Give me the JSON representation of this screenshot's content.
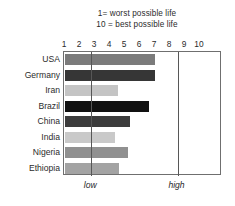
{
  "chart_data": {
    "type": "bar",
    "orientation": "horizontal",
    "title": "",
    "subtitle_lines": [
      "1= worst possible life",
      "10 = best possible life"
    ],
    "categories": [
      "USA",
      "Germany",
      "Iran",
      "Brazil",
      "China",
      "India",
      "Nigeria",
      "Ethiopia"
    ],
    "values": [
      7.0,
      7.0,
      4.5,
      6.6,
      5.3,
      4.3,
      5.2,
      4.6
    ],
    "bar_colors": [
      "#7b7b7b",
      "#363636",
      "#c4c4c4",
      "#111111",
      "#3c3c3c",
      "#c9c9c9",
      "#909090",
      "#a3a3a3"
    ],
    "series": [
      {
        "name": "life evaluation",
        "values": [
          7.0,
          7.0,
          4.5,
          6.6,
          5.3,
          4.3,
          5.2,
          4.6
        ]
      }
    ],
    "xlabel": "",
    "ylabel": "",
    "xlim": [
      1,
      11.5
    ],
    "xticks": [
      1,
      2,
      3,
      4,
      5,
      6,
      7,
      8,
      9,
      10
    ],
    "xticklabels": [
      "1",
      "2",
      "3",
      "4",
      "5",
      "6",
      "7",
      "8",
      "9",
      "10"
    ],
    "grid": false,
    "legend": "none",
    "annotations": [
      {
        "text": "low",
        "x": 2.75,
        "type": "vline-label"
      },
      {
        "text": "high",
        "x": 8.5,
        "type": "vline-label"
      }
    ],
    "reference_lines": [
      {
        "label": "low",
        "x": 2.75,
        "color": "#575757"
      },
      {
        "label": "high",
        "x": 8.5,
        "color": "#575757"
      }
    ],
    "colors": {
      "frame": "#6f6f6f",
      "text": "#2b2b2b",
      "reference_line": "#575757",
      "background": "#ffffff"
    }
  }
}
